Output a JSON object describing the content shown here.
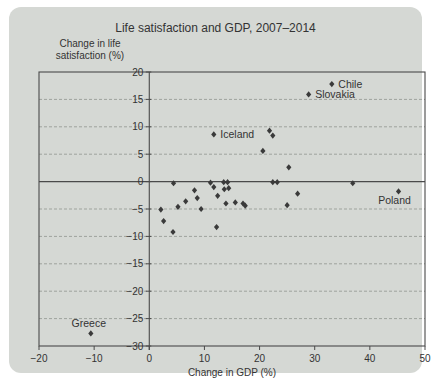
{
  "title": "Life satisfaction and GDP, 2007–2014",
  "y_axis_label": {
    "line1": "Change in life",
    "line2": "satisfaction (%)"
  },
  "colors": {
    "card_bg": "#d5d8d4",
    "axis": "#4a4a4a",
    "grid": "#9ea39d",
    "marker": "#3a3a3a",
    "text": "#333333"
  },
  "chart_data": {
    "type": "scatter",
    "title": "Life satisfaction and GDP, 2007–2014",
    "xlabel": "Change in GDP (%)",
    "ylabel": "Change in life satisfaction (%)",
    "xlim": [
      -20,
      50
    ],
    "ylim": [
      -30,
      20
    ],
    "x_ticks": [
      -20,
      -10,
      0,
      10,
      20,
      30,
      40,
      50
    ],
    "x_tick_labels": [
      "−20",
      "−10",
      "0",
      "10",
      "20",
      "30",
      "40",
      "50"
    ],
    "y_ticks": [
      20,
      15,
      10,
      5,
      0,
      -5,
      -10,
      -15,
      -20,
      -25,
      -30
    ],
    "y_tick_labels": [
      "20",
      "15",
      "10",
      "5",
      "0",
      "−5",
      "−10",
      "−15",
      "−20",
      "−25",
      "−30"
    ],
    "grid": "horizontal-dashed",
    "legend": "none",
    "marker": "diamond",
    "labeled_points": [
      {
        "label": "Chile",
        "x": 33.1,
        "y": 17.8,
        "label_pos": "right"
      },
      {
        "label": "Slovakia",
        "x": 28.9,
        "y": 15.9,
        "label_pos": "right"
      },
      {
        "label": "Iceland",
        "x": 11.7,
        "y": 8.6,
        "label_pos": "right"
      },
      {
        "label": "Poland",
        "x": 45.2,
        "y": -1.8,
        "label_pos": "below"
      },
      {
        "label": "Greece",
        "x": -10.6,
        "y": -27.7,
        "label_pos": "above"
      }
    ],
    "points": [
      [
        21.8,
        9.3
      ],
      [
        22.4,
        8.4
      ],
      [
        20.6,
        5.6
      ],
      [
        25.3,
        2.6
      ],
      [
        4.4,
        -0.3
      ],
      [
        11.1,
        -0.2
      ],
      [
        13.5,
        -0.1
      ],
      [
        14.2,
        -0.1
      ],
      [
        22.4,
        -0.1
      ],
      [
        23.2,
        -0.1
      ],
      [
        36.9,
        -0.3
      ],
      [
        11.7,
        -1.0
      ],
      [
        13.6,
        -1.4
      ],
      [
        14.4,
        -1.2
      ],
      [
        8.2,
        -1.6
      ],
      [
        12.4,
        -2.6
      ],
      [
        26.9,
        -2.2
      ],
      [
        8.7,
        -3.0
      ],
      [
        6.6,
        -3.6
      ],
      [
        5.2,
        -4.6
      ],
      [
        13.9,
        -4.0
      ],
      [
        15.6,
        -3.8
      ],
      [
        17.0,
        -4.0
      ],
      [
        17.4,
        -4.4
      ],
      [
        25.0,
        -4.3
      ],
      [
        2.1,
        -5.1
      ],
      [
        9.4,
        -5.0
      ],
      [
        2.6,
        -7.2
      ],
      [
        4.3,
        -9.2
      ],
      [
        12.2,
        -8.3
      ]
    ]
  }
}
